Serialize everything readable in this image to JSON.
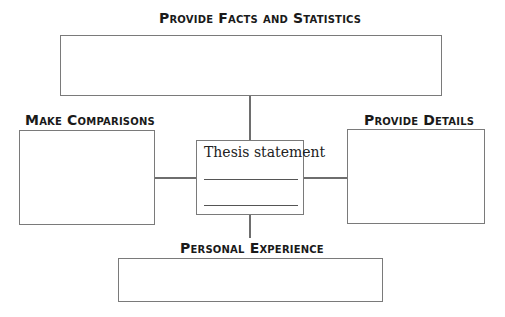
{
  "diagram": {
    "type": "graphic-organizer",
    "center": {
      "label": "Thesis statement",
      "blank_lines": 2
    },
    "branches": [
      {
        "position": "top",
        "label": "Provide Facts and Statistics"
      },
      {
        "position": "left",
        "label": "Make Comparisons"
      },
      {
        "position": "right",
        "label": "Provide Details"
      },
      {
        "position": "bottom",
        "label": "Personal Experience"
      }
    ]
  },
  "colors": {
    "border": "#7a7a7a",
    "text": "#1a1a1a",
    "background": "#ffffff"
  }
}
